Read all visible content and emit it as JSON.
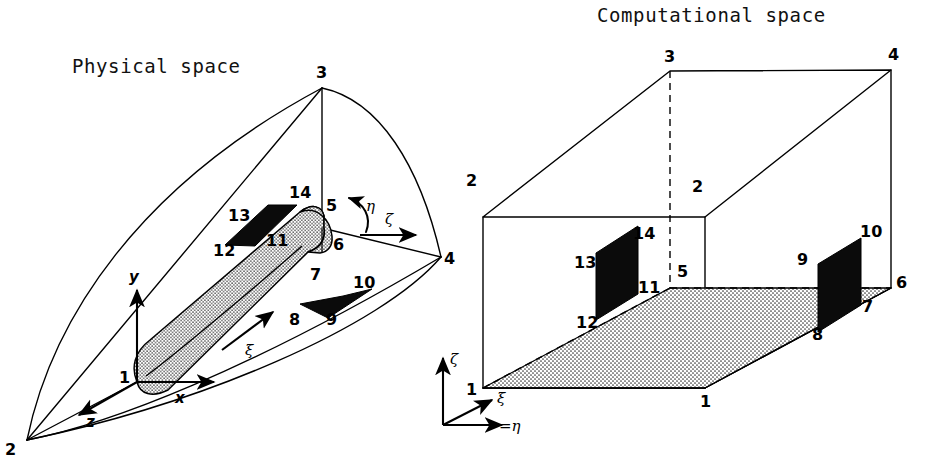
{
  "figure": {
    "panels": [
      {
        "id": "physical",
        "title": "Physical space",
        "node_labels": [
          "1",
          "2",
          "3",
          "4",
          "5",
          "6",
          "7",
          "8",
          "9",
          "10",
          "11",
          "12",
          "13",
          "14"
        ],
        "axes": [
          {
            "name": "x-axis",
            "label": "x",
            "direction": "right"
          },
          {
            "name": "y-axis",
            "label": "y",
            "direction": "up"
          },
          {
            "name": "z-axis",
            "label": "z",
            "direction": "down-left"
          }
        ],
        "curvilinear_axes": [
          {
            "name": "xi-axis",
            "label": "ξ",
            "direction": "along-body"
          },
          {
            "name": "eta-axis",
            "label": "η",
            "direction": "circumferential-arc"
          },
          {
            "name": "zeta-axis",
            "label": "ζ",
            "direction": "radial-right"
          }
        ]
      },
      {
        "id": "computational",
        "title": "Computational space",
        "node_labels": [
          "1",
          "1",
          "2",
          "2",
          "3",
          "4",
          "5",
          "6",
          "7",
          "8",
          "9",
          "10",
          "11",
          "12",
          "13",
          "14"
        ],
        "axes": [
          {
            "name": "zeta-axis",
            "label": "ζ",
            "direction": "up"
          },
          {
            "name": "xi-axis",
            "label": "ξ",
            "direction": "up-right-diagonal"
          },
          {
            "name": "eta-axis",
            "label": "=η",
            "direction": "right"
          }
        ]
      }
    ],
    "colors": {
      "line": "#000000",
      "panel_fill": "#0b0b0b",
      "stipple": "#d8d8d8",
      "background": "#ffffff"
    }
  }
}
